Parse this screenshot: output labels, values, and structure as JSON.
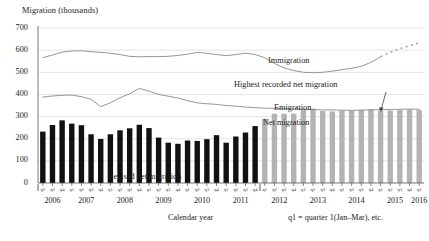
{
  "chart_data": {
    "type": "bar",
    "title": "Migration (thousands)",
    "xlabel": "Calendar year",
    "ylabel": "Migration (thousands)",
    "ylim": [
      0,
      700
    ],
    "yticks": [
      0,
      100,
      200,
      300,
      400,
      500,
      600,
      700
    ],
    "grid": true,
    "legend_position": "inline-annotations",
    "categories": [
      "q2 2006",
      "q3 2006",
      "q4 2006",
      "q1 2007",
      "q2 2007",
      "q3 2007",
      "q4 2007",
      "q1 2008",
      "q2 2008",
      "q3 2008",
      "q4 2008",
      "q1 2009",
      "q2 2009",
      "q3 2009",
      "q4 2009",
      "q1 2010",
      "q2 2010",
      "q3 2010",
      "q4 2010",
      "q1 2011",
      "q2 2011",
      "q3 2011",
      "q4 2011",
      "q1 2012",
      "q2 2012",
      "q3 2012",
      "q4 2012",
      "q1 2013",
      "q2 2013",
      "q3 2013",
      "q4 2013",
      "q1 2014",
      "q2 2014",
      "q3 2014",
      "q4 2014",
      "q1 2015",
      "q2 2015",
      "q3 2015",
      "q4 2015",
      "q1 2016"
    ],
    "quarter_ticks": [
      "q2",
      "q3",
      "q4",
      "q1",
      "q2",
      "q3",
      "q4",
      "q1",
      "q2",
      "q3",
      "q4",
      "q1",
      "q2",
      "q3",
      "q4",
      "q1",
      "q2",
      "q3",
      "q4",
      "q1",
      "q2",
      "q3",
      "q4",
      "q1",
      "q2",
      "q3",
      "q4",
      "q1",
      "q2",
      "q3",
      "q4",
      "q1",
      "q2",
      "q3",
      "q4",
      "q1",
      "q2",
      "q3",
      "q4",
      "q1"
    ],
    "years": [
      "2006",
      "2007",
      "2008",
      "2009",
      "2010",
      "2011",
      "2012",
      "2013",
      "2014",
      "2015",
      "2016"
    ],
    "series": [
      {
        "name": "Net migration",
        "type": "bar",
        "values": [
          232,
          262,
          283,
          268,
          261,
          220,
          199,
          220,
          238,
          247,
          263,
          248,
          205,
          182,
          177,
          192,
          190,
          198,
          216,
          182,
          210,
          228,
          257,
          290,
          313,
          313,
          313,
          330,
          336,
          325,
          323,
          327,
          327,
          331,
          333,
          327,
          327,
          330,
          333,
          330
        ],
        "revised_count": 23,
        "revised_color": "#111111",
        "provisional_color": "#b3b3b3"
      },
      {
        "name": "Immigration",
        "type": "line",
        "color": "#8a8a8a",
        "values": [
          566,
          578,
          591,
          596,
          597,
          593,
          590,
          586,
          580,
          572,
          570,
          571,
          571,
          572,
          576,
          582,
          590,
          586,
          580,
          575,
          580,
          586,
          580,
          566,
          540,
          520,
          508,
          500,
          498,
          500,
          505,
          512,
          518,
          527,
          545,
          570,
          590,
          606,
          620,
          633
        ],
        "dashed_from_index": 35
      },
      {
        "name": "Emigration",
        "type": "line",
        "color": "#8a8a8a",
        "values": [
          388,
          393,
          396,
          397,
          390,
          378,
          345,
          362,
          385,
          403,
          427,
          415,
          400,
          392,
          384,
          372,
          362,
          358,
          355,
          350,
          347,
          343,
          340,
          338,
          337,
          336,
          335,
          333,
          332,
          330,
          330,
          329,
          328,
          329,
          330,
          331,
          332,
          333,
          334,
          333
        ]
      }
    ],
    "annotations": [
      {
        "text": "Immigration",
        "x": 0.6,
        "y": 560
      },
      {
        "text": "Emigration",
        "x": 0.62,
        "y": 355
      },
      {
        "text": "Net migration",
        "x": 0.56,
        "y": 290
      },
      {
        "text": "Highest recorded net migration",
        "x": 0.56,
        "y": 430
      },
      {
        "text": "Revised net migration",
        "x": 0.28,
        "y": 20
      }
    ],
    "footnote": "q1 = quarter 1(Jan–Mar), etc.",
    "colors": {
      "revised_bar": "#111111",
      "provisional_bar": "#b3b3b3",
      "line": "#8a8a8a",
      "gridline": "#d9d9d9",
      "axis": "#555555",
      "text": "#1a1a1a"
    }
  }
}
